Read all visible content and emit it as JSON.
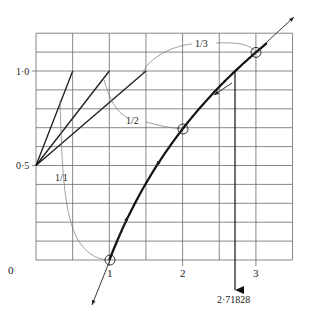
{
  "diagram": {
    "curve": "y = ln(x)",
    "x_axis": {
      "origin_label": "0",
      "tick_labels": [
        "1",
        "2",
        "3"
      ],
      "tick_values": [
        1,
        2,
        3
      ],
      "range": [
        0,
        3.5
      ],
      "grid_step": 0.5
    },
    "y_axis": {
      "tick_labels": [
        "0·5",
        "1·0"
      ],
      "tick_values": [
        0.5,
        1.0
      ],
      "range": [
        0,
        1.2
      ],
      "grid_step": 0.1
    },
    "slope_labels": [
      "1/1",
      "1/2",
      "1/3"
    ],
    "slope_pivot": {
      "x": 0,
      "y": 0.5
    },
    "slope_line_ends": [
      {
        "x": 0.5,
        "y": 1.0
      },
      {
        "x": 1.0,
        "y": 1.0
      },
      {
        "x": 1.5,
        "y": 1.0
      }
    ],
    "marked_points": [
      {
        "x": 1,
        "y": 0
      },
      {
        "x": 2,
        "y": 0.6931
      },
      {
        "x": 3,
        "y": 1.0986
      }
    ],
    "e_marker": {
      "label": "2·71828",
      "x": 2.71828
    },
    "colors": {
      "ink": "#222222",
      "grid": "#555555",
      "thin": "#666666"
    }
  }
}
